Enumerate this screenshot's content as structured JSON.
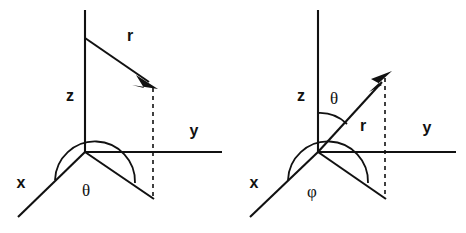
{
  "figure": {
    "title": "",
    "background_color": "#ffffff",
    "line_color": "#111111",
    "width": 466,
    "height": 233
  },
  "diagrams": [
    {
      "id": "cylindrical-polar-left",
      "name": "left-coordinate-diagram",
      "origin": {
        "x": 85,
        "y": 152
      },
      "axes": [
        {
          "name": "z-axis",
          "label": "z",
          "label_x": 70,
          "label_y": 101,
          "from": {
            "x": 85,
            "y": 10
          },
          "to": {
            "x": 85,
            "y": 152
          }
        },
        {
          "name": "y-axis",
          "label": "y",
          "label_x": 194,
          "label_y": 136,
          "from": {
            "x": 85,
            "y": 152
          },
          "to": {
            "x": 222,
            "y": 152
          }
        },
        {
          "name": "x-axis",
          "label": "x",
          "label_x": 21,
          "label_y": 188,
          "from": {
            "x": 85,
            "y": 152
          },
          "to": {
            "x": 18,
            "y": 217
          }
        }
      ],
      "vector": {
        "name": "r-vector",
        "label": "r",
        "label_x": 130,
        "label_y": 41,
        "from": {
          "x": 85,
          "y": 38
        },
        "to": {
          "x": 157,
          "y": 87
        }
      },
      "projection_line": {
        "name": "projection-dashed-line",
        "from": {
          "x": 153,
          "y": 88
        },
        "to": {
          "x": 153,
          "y": 198
        },
        "style": "dashed"
      },
      "ground_line": {
        "name": "ground-projection-line",
        "from": {
          "x": 85,
          "y": 152
        },
        "to": {
          "x": 153,
          "y": 198
        }
      },
      "angle": {
        "name": "theta-angle",
        "label": "θ",
        "label_x": 86,
        "label_y": 196,
        "between": [
          "x-axis",
          "ground-projection-line"
        ]
      }
    },
    {
      "id": "spherical-polar-right",
      "name": "right-coordinate-diagram",
      "origin": {
        "x": 318,
        "y": 152
      },
      "axes": [
        {
          "name": "z-axis",
          "label": "z",
          "label_x": 301,
          "label_y": 101,
          "from": {
            "x": 318,
            "y": 10
          },
          "to": {
            "x": 318,
            "y": 152
          }
        },
        {
          "name": "y-axis",
          "label": "y",
          "label_x": 427,
          "label_y": 133,
          "from": {
            "x": 318,
            "y": 152
          },
          "to": {
            "x": 456,
            "y": 152
          }
        },
        {
          "name": "x-axis",
          "label": "x",
          "label_x": 254,
          "label_y": 188,
          "from": {
            "x": 318,
            "y": 152
          },
          "to": {
            "x": 250,
            "y": 217
          }
        }
      ],
      "vector": {
        "name": "r-vector",
        "label": "r",
        "label_x": 363,
        "label_y": 131,
        "from": {
          "x": 318,
          "y": 152
        },
        "to": {
          "x": 391,
          "y": 72
        }
      },
      "projection_line": {
        "name": "projection-dashed-line",
        "from": {
          "x": 385,
          "y": 78
        },
        "to": {
          "x": 385,
          "y": 198
        },
        "style": "dashed"
      },
      "ground_line": {
        "name": "ground-projection-line",
        "from": {
          "x": 318,
          "y": 152
        },
        "to": {
          "x": 385,
          "y": 198
        }
      },
      "angles": [
        {
          "name": "theta-angle",
          "label": "θ",
          "label_x": 334,
          "label_y": 104,
          "between": [
            "z-axis",
            "r-vector"
          ]
        },
        {
          "name": "phi-angle",
          "label": "φ",
          "label_x": 312,
          "label_y": 197,
          "between": [
            "x-axis",
            "ground-projection-line"
          ]
        }
      ]
    }
  ]
}
